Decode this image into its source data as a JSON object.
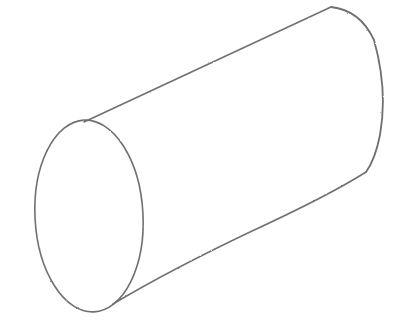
{
  "drawing": {
    "subject": "cylinder",
    "style": "pencil sketch",
    "background": "#ffffff",
    "stroke_color": "#6e6e6e",
    "front_ellipse": {
      "cx": 89,
      "cy": 216,
      "rx": 54,
      "ry": 96
    },
    "top_edge": {
      "x1": 85,
      "y1": 121,
      "x2": 330,
      "y2": 7
    },
    "bottom_edge": {
      "x1": 113,
      "y1": 304,
      "x2": 368,
      "y2": 172
    }
  }
}
